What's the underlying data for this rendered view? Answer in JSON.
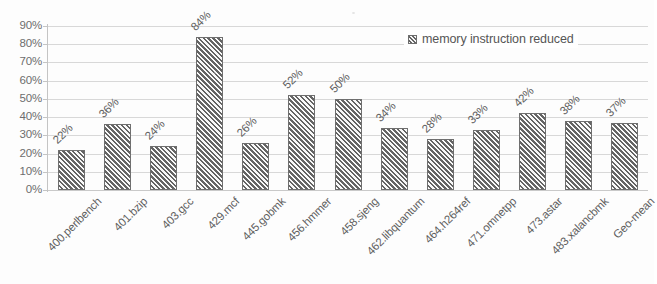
{
  "chart_data": {
    "type": "bar",
    "title": "",
    "xlabel": "",
    "ylabel": "",
    "ylim": [
      0,
      90
    ],
    "ytick_step": 10,
    "grid": true,
    "legend_position": "top-right",
    "series": [
      {
        "name": "memory instruction reduced",
        "values": [
          22,
          36,
          24,
          84,
          26,
          52,
          50,
          34,
          28,
          33,
          42,
          38,
          37
        ]
      }
    ],
    "categories": [
      "400.perlbench",
      "401.bzip",
      "403.gcc",
      "429.mcf",
      "445.gobmk",
      "456.hmmer",
      "458.sjeng",
      "462.libquantum",
      "464.h264ref",
      "471.omnetpp",
      "473.astar",
      "483.xalancbmk",
      "Geo-mean"
    ],
    "ytick_labels": [
      "90%",
      "80%",
      "70%",
      "60%",
      "50%",
      "40%",
      "30%",
      "20%",
      "10%",
      "0%"
    ],
    "data_labels": [
      "22%",
      "36%",
      "24%",
      "84%",
      "26%",
      "52%",
      "50%",
      "34%",
      "28%",
      "33%",
      "42%",
      "38%",
      "37%"
    ],
    "colors": {
      "bar_fill": "#b4b4b4",
      "bar_border": "#6f6f6f",
      "gridline": "#d8d8d8",
      "axis": "#c4c4c4",
      "text": "#5f5f5f",
      "background": "#fdfdfd"
    }
  },
  "legend": {
    "entries": [
      {
        "label": "memory instruction reduced",
        "swatch": "hatched-gray-swatch"
      }
    ]
  }
}
